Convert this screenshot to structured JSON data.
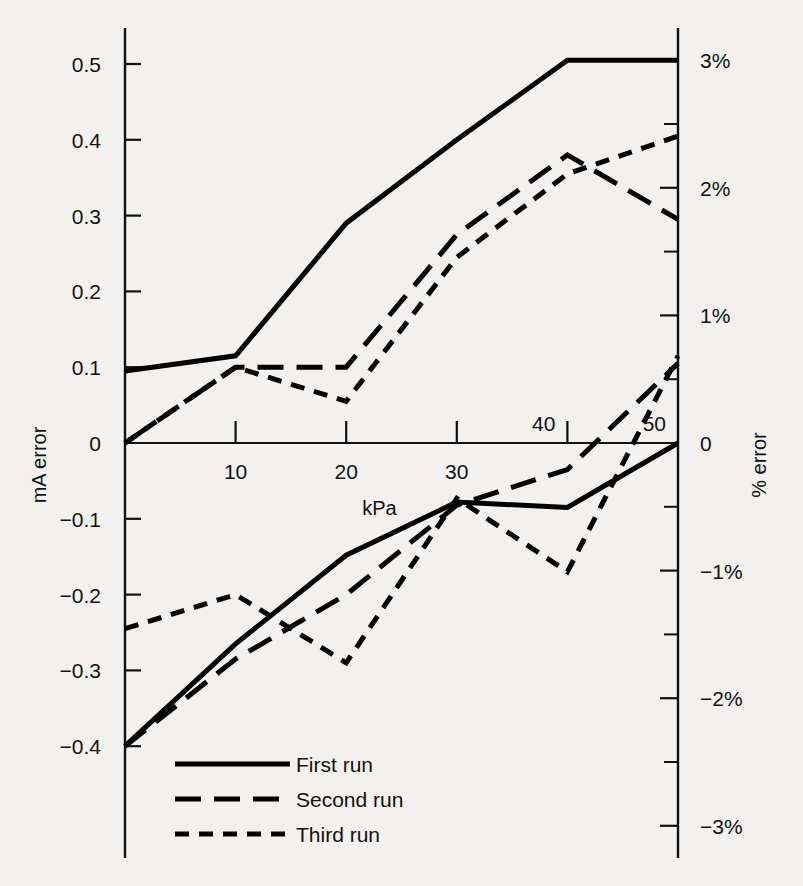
{
  "figure": {
    "background_color": "#f2f1ef",
    "ink_color": "#111111"
  },
  "axes": {
    "left": {
      "title": "mA error",
      "tick_labels": [
        "0.5",
        "0.4",
        "0.3",
        "0.2",
        "0.1",
        "0",
        "−0.1",
        "−0.2",
        "−0.3",
        "−0.4"
      ],
      "tick_values": [
        0.5,
        0.4,
        0.3,
        0.2,
        0.1,
        0,
        -0.1,
        -0.2,
        -0.3,
        -0.4
      ]
    },
    "right": {
      "title": "% error",
      "tick_labels": [
        "3%",
        "2%",
        "1%",
        "0",
        "−1%",
        "−2%",
        "−3%"
      ],
      "tick_values": [
        3,
        2,
        1,
        0,
        -1,
        -2,
        -3
      ],
      "minor_tick_values": [
        2.5,
        1.5,
        0.5,
        -0.5,
        -1.5,
        -2.5
      ]
    },
    "bottom": {
      "title": "kPa",
      "tick_labels": [
        "10",
        "20",
        "30",
        "40",
        "50"
      ],
      "tick_values": [
        10,
        20,
        30,
        40,
        50
      ]
    }
  },
  "legend": {
    "items": [
      {
        "label": "First run",
        "style": "solid"
      },
      {
        "label": "Second run",
        "style": "long-dash"
      },
      {
        "label": "Third run",
        "style": "short-dash"
      }
    ]
  },
  "chart_data": {
    "type": "line",
    "title": "",
    "xlabel": "kPa",
    "ylabel": "mA error",
    "y2label": "% error",
    "xlim": [
      0,
      50
    ],
    "ylim": [
      -0.45,
      0.55
    ],
    "y2lim": [
      -3.4,
      3.4
    ],
    "grid": false,
    "legend_position": "bottom-left",
    "x": [
      0,
      10,
      20,
      30,
      40,
      50
    ],
    "series": [
      {
        "name": "First run (upscale)",
        "style": "solid",
        "values": [
          0.095,
          0.115,
          0.29,
          0.4,
          0.505,
          0.505
        ]
      },
      {
        "name": "Second run (upscale)",
        "style": "long-dash",
        "values": [
          0.0,
          0.1,
          0.1,
          0.275,
          0.38,
          0.295
        ]
      },
      {
        "name": "Third run (upscale)",
        "style": "short-dash",
        "values": [
          0.0,
          0.1,
          0.055,
          0.245,
          0.355,
          0.405
        ]
      },
      {
        "name": "First run (downscale)",
        "style": "solid",
        "values": [
          -0.4,
          -0.265,
          -0.148,
          -0.078,
          -0.085,
          0.0
        ]
      },
      {
        "name": "Second run (downscale)",
        "style": "long-dash",
        "values": [
          -0.4,
          -0.285,
          -0.2,
          -0.082,
          -0.035,
          0.105
        ]
      },
      {
        "name": "Third run (downscale)",
        "style": "short-dash",
        "values": [
          -0.245,
          -0.2,
          -0.29,
          -0.073,
          -0.17,
          0.115
        ]
      }
    ]
  }
}
